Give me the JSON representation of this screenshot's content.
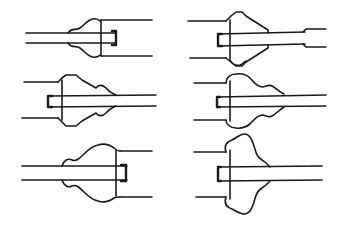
{
  "diagram": {
    "type": "technical-line-drawing",
    "stroke_color": "#1a1a1a",
    "background": "#ffffff",
    "figures": [
      {
        "id": "fig-1",
        "position": "top-left",
        "shape": "small rod into large tube, wavy bulge on left of tube end"
      },
      {
        "id": "fig-2",
        "position": "top-right",
        "shape": "large tube into tapered cone fitting, rod exits right with step-down"
      },
      {
        "id": "fig-3",
        "position": "middle-left",
        "shape": "large tube with stepped cone fitting and wavy bulge, rod exits right"
      },
      {
        "id": "fig-4",
        "position": "middle-right",
        "shape": "large tube with wavy lobed fitting, rod exits right"
      },
      {
        "id": "fig-5",
        "position": "bottom-left",
        "shape": "rod into tube from left with wavy bulge, tube on right"
      },
      {
        "id": "fig-6",
        "position": "bottom-right",
        "shape": "large tube with single rounded blob fitting, rod exits right"
      }
    ]
  }
}
